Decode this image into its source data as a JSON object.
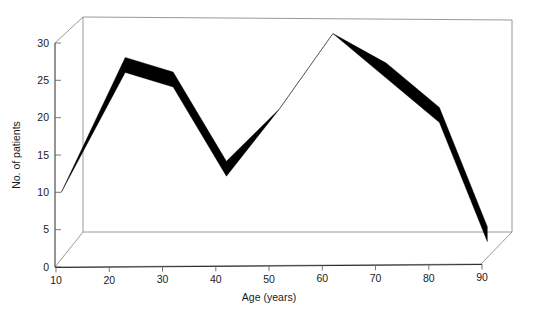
{
  "chart_data": {
    "type": "line",
    "title": "",
    "subtitle": "",
    "xlabel": "Age (years)",
    "ylabel": "No. of patients",
    "xlim": [
      10,
      90
    ],
    "ylim": [
      0,
      30
    ],
    "xticks": [
      10,
      20,
      30,
      40,
      50,
      60,
      70,
      80,
      90
    ],
    "xtick_labels": [
      "10",
      "20",
      "30",
      "40",
      "50",
      "60",
      "70",
      "80",
      "90"
    ],
    "yticks": [
      0,
      5,
      10,
      15,
      20,
      25,
      30
    ],
    "ytick_labels": [
      "0",
      "5",
      "10",
      "15",
      "20",
      "25",
      "30"
    ],
    "grid": false,
    "legend": "none",
    "style": "3d-ribbon-band",
    "series": [
      {
        "name": "No. of patients",
        "color": "#000000",
        "x": [
          11,
          23,
          32,
          42,
          52,
          62,
          72,
          82,
          91
        ],
        "values": [
          10,
          27,
          25,
          13,
          21,
          31,
          26,
          20,
          4
        ],
        "band_upper": [
          10,
          28,
          26,
          14,
          21,
          31,
          27,
          21,
          5
        ],
        "band_lower": [
          10,
          26,
          24,
          12,
          21,
          31,
          25,
          19,
          3
        ]
      }
    ],
    "annotations": []
  },
  "axes": {
    "y_axis_title": "No. of patients",
    "x_axis_title": "Age (years)"
  },
  "figure": {
    "background_color": "#ffffff",
    "frame_color": "#8d8d8d",
    "axis_color": "#2b2b2b",
    "series_color": "#000000"
  }
}
